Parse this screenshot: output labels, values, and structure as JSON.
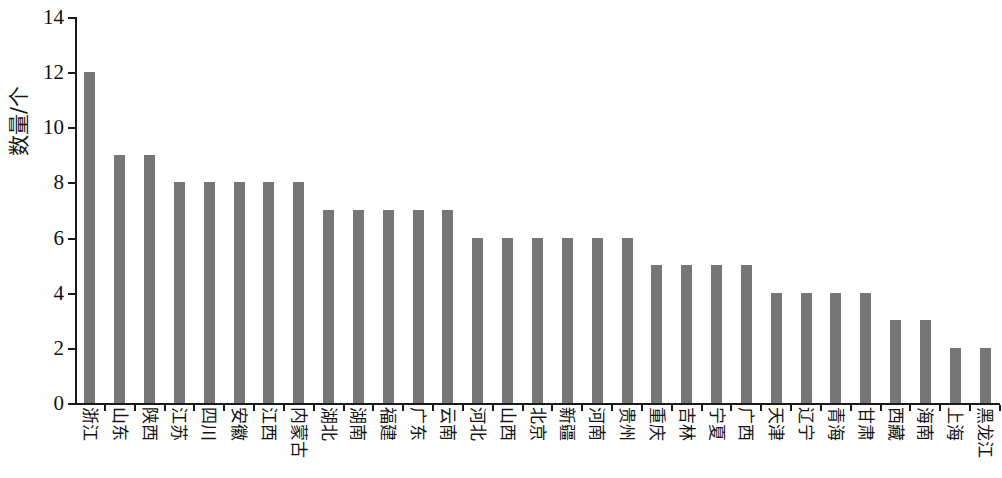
{
  "chart_data": {
    "type": "bar",
    "title": "",
    "xlabel": "",
    "ylabel": "数量/个",
    "ylim": [
      0,
      14
    ],
    "ytick_values": [
      14,
      12,
      10,
      8,
      6,
      4,
      2,
      0
    ],
    "ytick_labels": [
      "14",
      "12",
      "10",
      "8",
      "6",
      "4",
      "2",
      "0"
    ],
    "grid": false,
    "legend": null,
    "bar_color": "#767676",
    "axis_color": "#1a1a1a",
    "background_color": "#fefefe",
    "categories": [
      "浙江",
      "山东",
      "陕西",
      "江苏",
      "四川",
      "安徽",
      "江西",
      "内蒙古",
      "湖北",
      "湖南",
      "福建",
      "广东",
      "云南",
      "河北",
      "山西",
      "北京",
      "新疆",
      "河南",
      "贵州",
      "重庆",
      "吉林",
      "宁夏",
      "广西",
      "天津",
      "辽宁",
      "青海",
      "甘肃",
      "西藏",
      "海南",
      "上海",
      "黑龙江"
    ],
    "values": [
      12,
      9,
      9,
      8,
      8,
      8,
      8,
      8,
      7,
      7,
      7,
      7,
      7,
      6,
      6,
      6,
      6,
      6,
      6,
      5,
      5,
      5,
      5,
      4,
      4,
      4,
      4,
      3,
      3,
      2,
      2
    ]
  }
}
